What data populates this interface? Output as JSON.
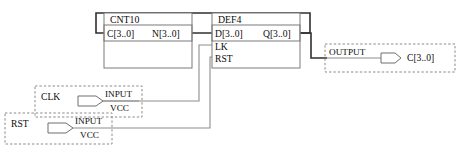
{
  "diagram": {
    "colors": {
      "wire": "#6b6b6b",
      "wire_bold": "#2f2f2f",
      "block_border": "#777777",
      "dashed_border": "#8a8a8a",
      "text": "#0b0b0b",
      "background": "#ffffff"
    }
  },
  "blocks": [
    {
      "id": "cnt10",
      "name": "CNT10",
      "ports_left": [
        "C[3..0]"
      ],
      "ports_right": [
        "N[3..0]"
      ]
    },
    {
      "id": "def4",
      "name": "DEF4",
      "ports_left": [
        "D[3..0]",
        "LK",
        "RST"
      ],
      "ports_right": [
        "Q[3..0]"
      ]
    }
  ],
  "pins": [
    {
      "id": "clk",
      "net_name": "CLK",
      "type": "INPUT",
      "default": "VCC",
      "symbol": "input-pin-symbol"
    },
    {
      "id": "rst",
      "net_name": "RST",
      "type": "INPUT",
      "default": "VCC",
      "symbol": "input-pin-symbol"
    },
    {
      "id": "out",
      "net_name": "C[3..0]",
      "type": "OUTPUT",
      "default": "",
      "symbol": "output-pin-symbol"
    }
  ]
}
